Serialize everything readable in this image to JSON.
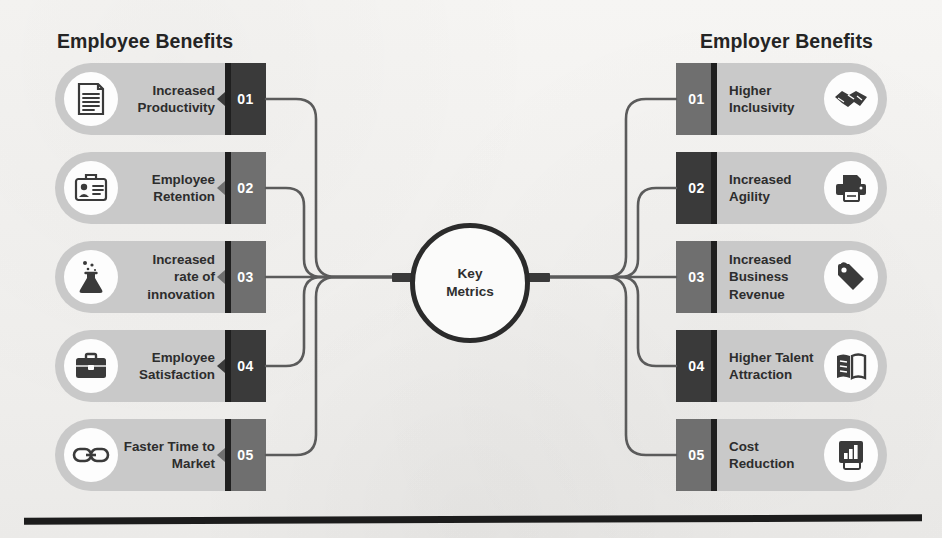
{
  "diagram": {
    "center": {
      "label": "Key\nMetrics",
      "label_plain": "Key Metrics"
    },
    "left_column": {
      "title": "Employee Benefits",
      "items": [
        {
          "number": "01",
          "label": "Increased\nProductivity",
          "label_plain": "Increased Productivity",
          "icon": "document-lines-icon",
          "block_shade": "dark"
        },
        {
          "number": "02",
          "label": "Employee\nRetention",
          "label_plain": "Employee Retention",
          "icon": "id-badge-briefcase-icon",
          "block_shade": "medium"
        },
        {
          "number": "03",
          "label": "Increased\nrate of\ninnovation",
          "label_plain": "Increased rate of innovation",
          "icon": "flask-bubbles-icon",
          "block_shade": "medium"
        },
        {
          "number": "04",
          "label": "Employee\nSatisfaction",
          "label_plain": "Employee Satisfaction",
          "icon": "briefcase-icon",
          "block_shade": "dark"
        },
        {
          "number": "05",
          "label": "Faster Time to\nMarket",
          "label_plain": "Faster Time to Market",
          "icon": "chain-link-icon",
          "block_shade": "medium"
        }
      ]
    },
    "right_column": {
      "title": "Employer Benefits",
      "items": [
        {
          "number": "01",
          "label": "Higher\nInclusivity",
          "label_plain": "Higher Inclusivity",
          "icon": "handshake-icon",
          "block_shade": "medium"
        },
        {
          "number": "02",
          "label": "Increased\nAgility",
          "label_plain": "Increased Agility",
          "icon": "printer-icon",
          "block_shade": "dark"
        },
        {
          "number": "03",
          "label": "Increased\nBusiness\nRevenue",
          "label_plain": "Increased Business Revenue",
          "icon": "price-tag-icon",
          "block_shade": "medium"
        },
        {
          "number": "04",
          "label": "Higher Talent\nAttraction",
          "label_plain": "Higher Talent Attraction",
          "icon": "open-book-icon",
          "block_shade": "dark"
        },
        {
          "number": "05",
          "label": "Cost\nReduction",
          "label_plain": "Cost Reduction",
          "icon": "bar-chart-report-icon",
          "block_shade": "medium"
        }
      ]
    },
    "colors": {
      "background": "#f3f2f0",
      "pill_fill": "#c9c9c9",
      "icon_disc": "#fdfdfd",
      "number_block_medium": "#6f6f6f",
      "number_block_dark": "#3a3a3a",
      "number_strip": "#1f1f1f",
      "text_dark": "#2d2d2d",
      "title_text": "#242424",
      "connector_line": "#5b5b5b",
      "hub_ring": "#2b2b2b",
      "bottom_rule": "#1c1c1c"
    }
  }
}
